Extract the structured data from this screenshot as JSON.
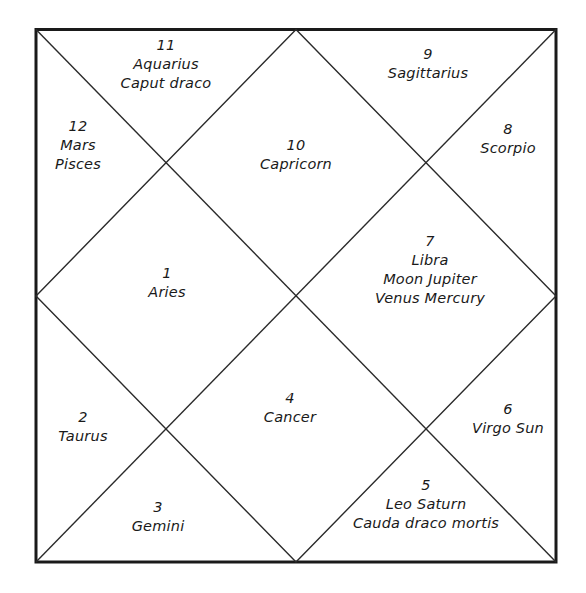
{
  "diagram": {
    "type": "north-indian-horoscope-chart",
    "frame": {
      "x1": 36,
      "y1": 29,
      "x2": 556,
      "y2": 562
    },
    "stroke_color": "#1a1a1a",
    "houses": [
      {
        "number": "1",
        "lines": [
          "Aries"
        ],
        "x": 167,
        "y": 264
      },
      {
        "number": "2",
        "lines": [
          "Taurus"
        ],
        "x": 83,
        "y": 408
      },
      {
        "number": "3",
        "lines": [
          "Gemini"
        ],
        "x": 158,
        "y": 498
      },
      {
        "number": "4",
        "lines": [
          "Cancer"
        ],
        "x": 290,
        "y": 389
      },
      {
        "number": "5",
        "lines": [
          "Leo Saturn",
          "Cauda draco mortis"
        ],
        "x": 426,
        "y": 476
      },
      {
        "number": "6",
        "lines": [
          "Virgo Sun"
        ],
        "x": 508,
        "y": 400
      },
      {
        "number": "7",
        "lines": [
          "Libra",
          "Moon Jupiter",
          "Venus Mercury"
        ],
        "x": 430,
        "y": 232
      },
      {
        "number": "8",
        "lines": [
          "Scorpio"
        ],
        "x": 508,
        "y": 120
      },
      {
        "number": "9",
        "lines": [
          "Sagittarius"
        ],
        "x": 428,
        "y": 45
      },
      {
        "number": "10",
        "lines": [
          "Capricorn"
        ],
        "x": 296,
        "y": 136
      },
      {
        "number": "11",
        "lines": [
          "Aquarius",
          "Caput draco"
        ],
        "x": 166,
        "y": 36
      },
      {
        "number": "12",
        "lines": [
          "Mars",
          "Pisces"
        ],
        "x": 78,
        "y": 117
      }
    ]
  }
}
